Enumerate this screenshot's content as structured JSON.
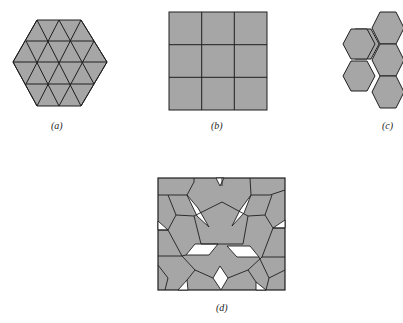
{
  "figure": {
    "colors": {
      "tile_fill": "#a6a6a6",
      "edge": "#1e1e1e",
      "gap": "#ffffff",
      "background": "#ffffff"
    },
    "panels": [
      {
        "id": "a",
        "label": "(a)",
        "description": "Regular hexagon tiled by equilateral triangles"
      },
      {
        "id": "b",
        "label": "(b)",
        "description": "Square tiled by 3x3 grid of squares"
      },
      {
        "id": "c",
        "label": "(c)",
        "description": "Honeycomb of regular hexagons"
      },
      {
        "id": "d",
        "label": "(d)",
        "description": "Pentagons tiling with white rhombic gaps"
      }
    ]
  }
}
